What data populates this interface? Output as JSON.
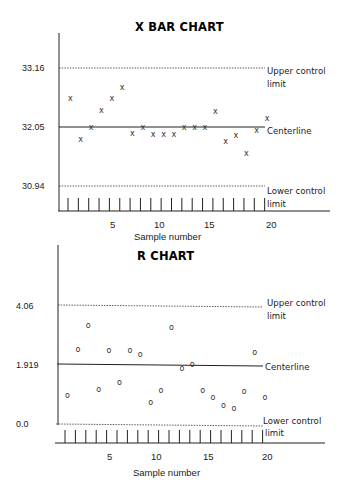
{
  "chart_data": [
    {
      "type": "scatter",
      "title": "X BAR CHART",
      "xlabel": "Sample number",
      "ylabel": "",
      "x_ticks": [
        5,
        10,
        15,
        20
      ],
      "y_ticks": [
        "30.94",
        "32.05",
        "33.16"
      ],
      "control_lines": {
        "upper": {
          "value": 33.16,
          "label_line1": "Upper control",
          "label_line2": "limit"
        },
        "center": {
          "value": 32.05,
          "label": "Centerline"
        },
        "lower": {
          "value": 30.94,
          "label_line1": "Lower control",
          "label_line2": "limit"
        }
      },
      "marker": "x",
      "x": [
        1,
        2,
        3,
        4,
        5,
        6,
        7,
        8,
        9,
        10,
        11,
        12,
        13,
        14,
        15,
        16,
        17,
        18,
        19,
        20
      ],
      "values": [
        32.6,
        31.82,
        32.05,
        32.37,
        32.6,
        32.8,
        31.94,
        32.05,
        31.92,
        31.92,
        31.92,
        32.05,
        32.05,
        32.05,
        32.35,
        31.79,
        31.9,
        31.56,
        32.0,
        32.22
      ],
      "ylim": [
        30.94,
        33.16
      ],
      "grid": false
    },
    {
      "type": "scatter",
      "title": "R CHART",
      "xlabel": "Sample number",
      "ylabel": "",
      "x_ticks": [
        5,
        10,
        15,
        20
      ],
      "y_ticks": [
        "0.0",
        "1.919",
        "4.06"
      ],
      "control_lines": {
        "upper": {
          "value": 4.06,
          "label_line1": "Upper control",
          "label_line2": "limit"
        },
        "center": {
          "value": 1.919,
          "label": "Centerline"
        },
        "lower": {
          "value": 0.0,
          "label_line1": "Lower control",
          "label_line2": "limit"
        }
      },
      "marker": "o",
      "x": [
        1,
        2,
        3,
        4,
        5,
        6,
        7,
        8,
        9,
        10,
        11,
        12,
        13,
        14,
        15,
        16,
        17,
        18,
        19,
        20
      ],
      "values": [
        1.01,
        2.57,
        3.37,
        1.23,
        2.53,
        1.45,
        2.53,
        2.39,
        0.79,
        1.19,
        3.33,
        1.92,
        2.06,
        1.19,
        0.94,
        0.69,
        0.58,
        1.16,
        2.46,
        0.94
      ],
      "ylim": [
        0.0,
        4.06
      ],
      "grid": false
    }
  ],
  "xbar": {
    "title": "X BAR CHART",
    "y_labels": {
      "ucl": "33.16",
      "cl": "32.05",
      "lcl": "30.94"
    },
    "right_labels": {
      "ucl1": "Upper control",
      "ucl2": "limit",
      "cl": "Centerline",
      "lcl1": "Lower control",
      "lcl2": "limit"
    },
    "x_tick_labels": {
      "t5": "5",
      "t10": "10",
      "t15": "15",
      "t20": "20"
    },
    "xlabel": "Sample number"
  },
  "rchart": {
    "title": "R CHART",
    "y_labels": {
      "ucl": "4.06",
      "cl": "1.919",
      "lcl": "0.0"
    },
    "right_labels": {
      "ucl1": "Upper control",
      "ucl2": "limit",
      "cl": "Centerline",
      "lcl1": "Lower control",
      "lcl2": "limit"
    },
    "x_tick_labels": {
      "t5": "5",
      "t10": "10",
      "t15": "15",
      "t20": "20"
    },
    "xlabel": "Sample number"
  }
}
